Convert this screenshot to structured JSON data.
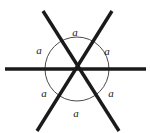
{
  "figure": {
    "kind": "geometry-diagram",
    "background_color": "#ffffff",
    "line_color": "#1a1a1a",
    "arc_color": "#4a4a4a",
    "label_color": "#1a1a1a",
    "line_width_px": 3.4,
    "arc_width_px": 1.0,
    "center": {
      "x": 77,
      "y": 69
    },
    "circle_radius": 32,
    "lines": [
      {
        "name": "horizontal-line",
        "x1": 5,
        "y1": 69,
        "x2": 146,
        "y2": 69
      },
      {
        "name": "diagonal-line-nw-se",
        "x1": 43,
        "y1": 11,
        "x2": 119,
        "y2": 131
      },
      {
        "name": "diagonal-line-ne-sw",
        "x1": 112,
        "y1": 11,
        "x2": 37,
        "y2": 131
      }
    ],
    "angle_labels": [
      {
        "name": "angle-label-top",
        "text": "a",
        "x": 75,
        "y": 32
      },
      {
        "name": "angle-label-upper-left",
        "text": "a",
        "x": 39,
        "y": 50
      },
      {
        "name": "angle-label-upper-right",
        "text": "a",
        "x": 107,
        "y": 51
      },
      {
        "name": "angle-label-lower-left",
        "text": "a",
        "x": 44,
        "y": 93
      },
      {
        "name": "angle-label-lower-right",
        "text": "a",
        "x": 111,
        "y": 93
      },
      {
        "name": "angle-label-bottom",
        "text": "a",
        "x": 76,
        "y": 113
      }
    ]
  }
}
